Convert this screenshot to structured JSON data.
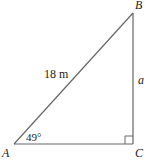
{
  "diagram": {
    "type": "right-triangle",
    "vertices": {
      "A": "A",
      "B": "B",
      "C": "C"
    },
    "hypotenuse_label": "18 m",
    "opposite_side_label": "a",
    "angle_A_label": "49°",
    "right_angle_at": "C",
    "stroke_color": "#666666"
  }
}
